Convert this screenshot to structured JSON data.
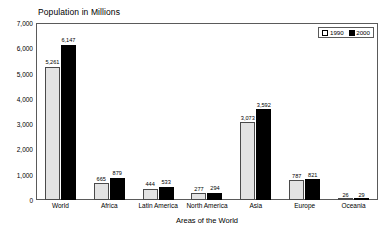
{
  "chart_data": {
    "type": "bar",
    "title": "Population in Millions",
    "xlabel": "Areas of the World",
    "ylabel": "",
    "ylim": [
      0,
      7000
    ],
    "grid": false,
    "legend_position": "top-right-inside",
    "categories": [
      "World",
      "Africa",
      "Latin America",
      "North America",
      "Asia",
      "Europe",
      "Oceania"
    ],
    "ytick_labels": [
      "7,000",
      "6,000",
      "5,000",
      "4,000",
      "3,000",
      "2,000",
      "1,000",
      "0"
    ],
    "ytick_values": [
      7000,
      6000,
      5000,
      4000,
      3000,
      2000,
      1000,
      0
    ],
    "series": [
      {
        "name": "1990",
        "color": "#e3e3e3",
        "values": [
          5261,
          665,
          444,
          277,
          3073,
          787,
          26
        ],
        "labels": [
          "5,261",
          "665",
          "444",
          "277",
          "3,073",
          "787",
          "26"
        ]
      },
      {
        "name": "2000",
        "color": "#000000",
        "values": [
          6147,
          879,
          533,
          294,
          3592,
          821,
          29
        ],
        "labels": [
          "6,147",
          "879",
          "533",
          "294",
          "3,592",
          "821",
          "29"
        ]
      }
    ]
  },
  "legend": {
    "items": [
      {
        "label": "1990",
        "swatch": "white-square"
      },
      {
        "label": "2000",
        "swatch": "black-square"
      }
    ]
  }
}
